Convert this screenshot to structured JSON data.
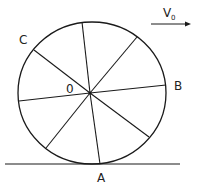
{
  "diagram": {
    "type": "rolling-wheel",
    "labels": {
      "center": "0",
      "point_a": "A",
      "point_b": "B",
      "point_c": "C",
      "velocity_main": "V",
      "velocity_sub": "0"
    },
    "spoke_count": 8,
    "stroke_color": "#1a1a1a",
    "background": "#ffffff"
  }
}
